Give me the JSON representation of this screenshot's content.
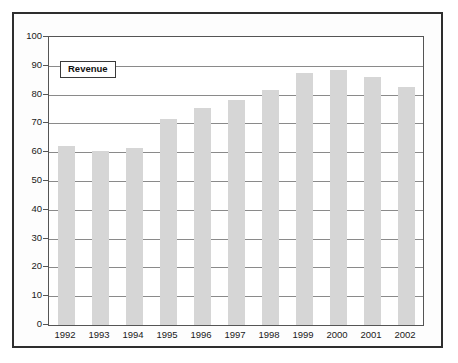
{
  "figure": {
    "frame_color": "#2e2e2e",
    "background": "#ffffff"
  },
  "legend": {
    "position": "inside-top-left",
    "entries": [
      {
        "label": "Revenue",
        "color": "#d6d6d6"
      }
    ]
  },
  "chart_data": {
    "type": "bar",
    "title": "",
    "subtitle": "",
    "xlabel": "",
    "ylabel": "",
    "categories": [
      "1992",
      "1993",
      "1994",
      "1995",
      "1996",
      "1997",
      "1998",
      "1999",
      "2000",
      "2001",
      "2002"
    ],
    "series": [
      {
        "name": "Revenue",
        "color": "#d6d6d6",
        "values": [
          62,
          60.5,
          61.5,
          71.5,
          75.5,
          78,
          81.5,
          87.5,
          88.5,
          86,
          82.5
        ]
      }
    ],
    "values": [
      62,
      60.5,
      61.5,
      71.5,
      75.5,
      78,
      81.5,
      87.5,
      88.5,
      86,
      82.5
    ],
    "ylim": [
      0,
      100
    ],
    "ytick_interval": 10,
    "ytick_labels": [
      "100",
      "90",
      "80",
      "70",
      "60",
      "50",
      "40",
      "30",
      "20",
      "10",
      "0"
    ],
    "ytick_values": [
      100,
      90,
      80,
      70,
      60,
      50,
      40,
      30,
      20,
      10,
      0
    ],
    "grid": "horizontal",
    "grid_color": "#8a8a8a",
    "legend_position": "top-left-inside",
    "bar_color": "#d6d6d6",
    "axis_color": "#555555"
  }
}
